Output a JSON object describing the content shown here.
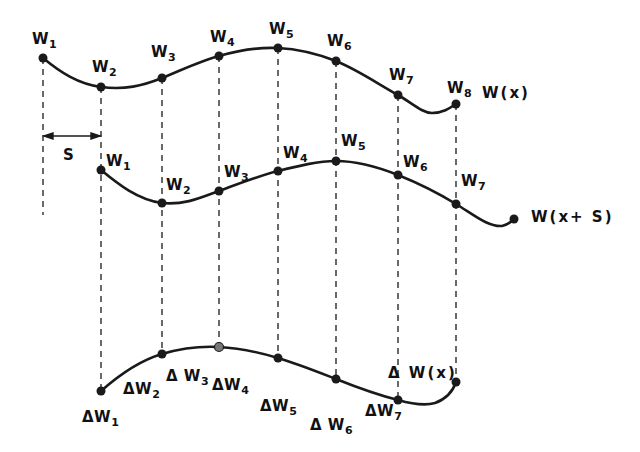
{
  "diagram": {
    "curves": [
      {
        "name": "W(x)",
        "label": "W(x)",
        "points": [
          {
            "label": "W",
            "sub": "1",
            "x": 43,
            "y": 58
          },
          {
            "label": "W",
            "sub": "2",
            "x": 101,
            "y": 87
          },
          {
            "label": "W",
            "sub": "3",
            "x": 162,
            "y": 78
          },
          {
            "label": "W",
            "sub": "4",
            "x": 219,
            "y": 56
          },
          {
            "label": "W",
            "sub": "5",
            "x": 278,
            "y": 48
          },
          {
            "label": "W",
            "sub": "6",
            "x": 336,
            "y": 61
          },
          {
            "label": "W",
            "sub": "7",
            "x": 398,
            "y": 95
          },
          {
            "label": "W",
            "sub": "8",
            "x": 456,
            "y": 104
          }
        ]
      },
      {
        "name": "W(x+S)",
        "label": "W(x+ S)",
        "points": [
          {
            "label": "W",
            "sub": "1",
            "x": 101,
            "y": 170
          },
          {
            "label": "W",
            "sub": "2",
            "x": 162,
            "y": 203
          },
          {
            "label": "W",
            "sub": "3",
            "x": 219,
            "y": 191
          },
          {
            "label": "W",
            "sub": "4",
            "x": 278,
            "y": 171
          },
          {
            "label": "W",
            "sub": "5",
            "x": 336,
            "y": 161
          },
          {
            "label": "W",
            "sub": "6",
            "x": 398,
            "y": 175
          },
          {
            "label": "W",
            "sub": "7",
            "x": 456,
            "y": 204
          }
        ]
      },
      {
        "name": "ΔW(x)",
        "label": "Δ W(x)",
        "points": [
          {
            "label": "ΔW",
            "sub": "1",
            "x": 101,
            "y": 391
          },
          {
            "label": "ΔW",
            "sub": "2",
            "x": 162,
            "y": 354
          },
          {
            "label": "Δ W",
            "sub": "3",
            "x": 219,
            "y": 347
          },
          {
            "label": "ΔW",
            "sub": "4",
            "x": 278,
            "y": 358
          },
          {
            "label": "ΔW",
            "sub": "5",
            "x": 336,
            "y": 379
          },
          {
            "label": "Δ W",
            "sub": "6",
            "x": 398,
            "y": 400
          },
          {
            "label": "ΔW",
            "sub": "7",
            "x": 456,
            "y": 382
          }
        ]
      }
    ],
    "shift_label": "S",
    "curve_labels": {
      "wx": "W(x)",
      "wxs": "W(x+ S)",
      "dwx": "Δ W(x)"
    },
    "colors": {
      "ink": "#1a1a1a",
      "background": "#ffffff"
    }
  }
}
